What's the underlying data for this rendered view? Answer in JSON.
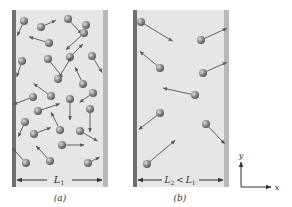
{
  "figure": {
    "colors": {
      "background": "#ffffff",
      "box_fill": "#e6e6e6",
      "left_wall": "#707070",
      "right_wall": "#b8b8b8",
      "molecule": "#8a8a8a",
      "molecule_highlight": "#d8d8d8",
      "arrow": "#555555",
      "text": "#333333"
    },
    "panels": [
      {
        "id": "a",
        "caption": "(a)",
        "width_label": "L",
        "width_label_sub": "1",
        "molecule_count": 26,
        "molecules": [
          {
            "x": 24,
            "y": 21,
            "dx": -5,
            "dy": 11
          },
          {
            "x": 41,
            "y": 27,
            "dx": 11,
            "dy": -5
          },
          {
            "x": 68,
            "y": 19,
            "dx": 11,
            "dy": 12
          },
          {
            "x": 84,
            "y": 33,
            "dx": -15,
            "dy": 14
          },
          {
            "x": 49,
            "y": 43,
            "dx": -16,
            "dy": -5
          },
          {
            "x": 86,
            "y": 25,
            "dx": 0,
            "dy": 0
          },
          {
            "x": 22,
            "y": 61,
            "dx": -4,
            "dy": 12
          },
          {
            "x": 48,
            "y": 59,
            "dx": 12,
            "dy": 15
          },
          {
            "x": 70,
            "y": 57,
            "dx": 10,
            "dy": -10
          },
          {
            "x": 92,
            "y": 56,
            "dx": 8,
            "dy": 13
          },
          {
            "x": 58,
            "y": 79,
            "dx": 11,
            "dy": -18
          },
          {
            "x": 83,
            "y": 84,
            "dx": -6,
            "dy": -13
          },
          {
            "x": 51,
            "y": 96,
            "dx": -14,
            "dy": -10
          },
          {
            "x": 33,
            "y": 97,
            "dx": -16,
            "dy": 6
          },
          {
            "x": 70,
            "y": 99,
            "dx": 0,
            "dy": 17
          },
          {
            "x": 93,
            "y": 93,
            "dx": -10,
            "dy": 7
          },
          {
            "x": 38,
            "y": 111,
            "dx": 18,
            "dy": -6
          },
          {
            "x": 90,
            "y": 109,
            "dx": 0,
            "dy": 19
          },
          {
            "x": 25,
            "y": 122,
            "dx": -5,
            "dy": 11
          },
          {
            "x": 60,
            "y": 130,
            "dx": -7,
            "dy": -14
          },
          {
            "x": 34,
            "y": 134,
            "dx": 13,
            "dy": -5
          },
          {
            "x": 80,
            "y": 131,
            "dx": 14,
            "dy": 8
          },
          {
            "x": 62,
            "y": 145,
            "dx": 18,
            "dy": 0
          },
          {
            "x": 26,
            "y": 163,
            "dx": -11,
            "dy": -12
          },
          {
            "x": 50,
            "y": 161,
            "dx": -11,
            "dy": -12
          },
          {
            "x": 88,
            "y": 163,
            "dx": 8,
            "dy": -4
          }
        ]
      },
      {
        "id": "b",
        "caption": "(b)",
        "width_label": "L",
        "width_label_sub": "2",
        "width_relation": "<",
        "width_label_2": "L",
        "width_label_2_sub": "1",
        "molecule_count": 10,
        "molecules": [
          {
            "x": 141,
            "y": 22,
            "dx": 28,
            "dy": 17
          },
          {
            "x": 201,
            "y": 40,
            "dx": 22,
            "dy": -10
          },
          {
            "x": 160,
            "y": 68,
            "dx": -17,
            "dy": -14
          },
          {
            "x": 203,
            "y": 73,
            "dx": 20,
            "dy": -9
          },
          {
            "x": 195,
            "y": 95,
            "dx": -28,
            "dy": -6
          },
          {
            "x": 160,
            "y": 113,
            "dx": -18,
            "dy": 14
          },
          {
            "x": 206,
            "y": 124,
            "dx": 16,
            "dy": 17
          },
          {
            "x": 147,
            "y": 164,
            "dx": 25,
            "dy": -21
          }
        ]
      }
    ],
    "axes": {
      "x_label": "x",
      "y_label": "y"
    }
  }
}
